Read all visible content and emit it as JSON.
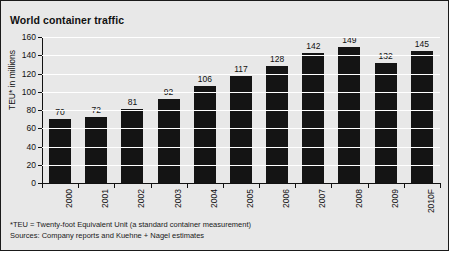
{
  "chart_data": {
    "type": "bar",
    "title": "World container traffic",
    "xlabel": "",
    "ylabel": "TEU* in millions",
    "categories": [
      "2000",
      "2001",
      "2002",
      "2003",
      "2004",
      "2005",
      "2006",
      "2007",
      "2008",
      "2009",
      "2010F"
    ],
    "values": [
      70,
      72,
      81,
      92,
      106,
      117,
      128,
      142,
      149,
      132,
      145
    ],
    "ylim": [
      0,
      160
    ],
    "yticks": [
      0,
      20,
      40,
      60,
      80,
      100,
      120,
      140,
      160
    ],
    "ytick_labels": [
      "0",
      "20",
      "40",
      "60",
      "80",
      "100",
      "120",
      "140",
      "160"
    ],
    "grid": true,
    "grid_color": "#ffffff",
    "legend": false,
    "bar_color": "#141414",
    "background_color": "#e8e8e8",
    "text_color": "#111111",
    "data_labels": [
      "70",
      "72",
      "81",
      "92",
      "106",
      "117",
      "128",
      "142",
      "149",
      "132",
      "145"
    ]
  },
  "footnotes": {
    "teu_note": "*TEU = Twenty-foot Equivalent Unit (a standard container measurement)",
    "sources": "Sources: Company reports and Kuehne + Nagel estimates"
  }
}
